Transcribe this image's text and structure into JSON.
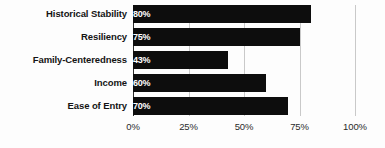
{
  "chart_data": {
    "type": "bar",
    "orientation": "horizontal",
    "title": "",
    "subtitle": "",
    "xlabel": "",
    "ylabel": "",
    "categories": [
      "Historical Stability",
      "Resiliency",
      "Family-Centeredness",
      "Income",
      "Ease of Entry"
    ],
    "values": [
      80,
      75,
      43,
      60,
      70
    ],
    "value_labels": [
      "80%",
      "75%",
      "43%",
      "60%",
      "70%"
    ],
    "xlim": [
      0,
      100
    ],
    "xticks": [
      0,
      25,
      50,
      75,
      100
    ],
    "xtick_labels": [
      "0%",
      "25%",
      "50%",
      "75%",
      "100%"
    ],
    "grid": true,
    "grid_axis": "x",
    "legend": false,
    "legend_position": "none",
    "series": [
      {
        "name": "",
        "values": [
          80,
          75,
          43,
          60,
          70
        ]
      }
    ],
    "colors": {
      "bar": "#0d0d0d",
      "bar_label_text": "#ffffff",
      "category_label_text": "#141414",
      "tick_label_text": "#2b2b2b",
      "gridline": "#c9c9c9",
      "axis_line": "#2b2b2b",
      "background": "#fdfdfd"
    }
  }
}
